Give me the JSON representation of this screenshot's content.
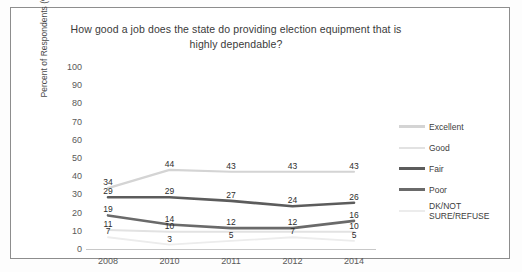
{
  "chart_data": {
    "type": "line",
    "title": "How good a job does the state do providing election equipment that is highly dependable?",
    "xlabel": "",
    "ylabel": "Percent of Respondents (%)",
    "categories": [
      "2008",
      "2010",
      "2011",
      "2012",
      "2014"
    ],
    "yticks": [
      100,
      90,
      80,
      70,
      60,
      50,
      40,
      30,
      20,
      10,
      0
    ],
    "ylim": [
      0,
      100
    ],
    "grid": false,
    "legend_position": "right",
    "series": [
      {
        "name": "Excellent",
        "color": "#d4d4d4",
        "width": 2.2,
        "values": [
          34,
          44,
          43,
          43,
          43
        ],
        "labels": [
          "34",
          "44",
          "43",
          "43",
          "43"
        ]
      },
      {
        "name": "Good",
        "color": "#e2e2e2",
        "width": 2.0,
        "values": [
          11,
          10,
          10,
          10,
          10
        ],
        "labels": [
          "11",
          "10",
          "",
          "",
          "10"
        ]
      },
      {
        "name": "Fair",
        "color": "#5c5c5c",
        "width": 2.6,
        "values": [
          29,
          29,
          27,
          24,
          26
        ],
        "labels": [
          "29",
          "29",
          "27",
          "24",
          "26"
        ]
      },
      {
        "name": "Poor",
        "color": "#6a6a6a",
        "width": 2.6,
        "values": [
          19,
          14,
          12,
          12,
          16
        ],
        "labels": [
          "19",
          "14",
          "12",
          "12",
          "16"
        ]
      },
      {
        "name": "DK/NOT SURE/REFUSE",
        "color": "#ececec",
        "width": 1.8,
        "values": [
          7,
          3,
          5,
          7,
          5
        ],
        "labels": [
          "7",
          "3",
          "5",
          "7",
          "5"
        ]
      }
    ]
  }
}
